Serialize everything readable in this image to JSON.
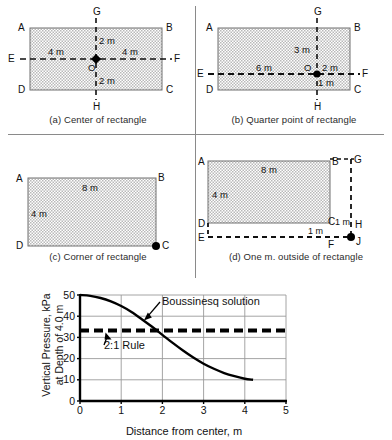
{
  "figure": {
    "panels": [
      {
        "id": "a",
        "caption": "(a) Center of rectangle",
        "corners": {
          "tl": "A",
          "tr": "B",
          "bl": "D",
          "br": "C"
        },
        "axis_points": {
          "top": "G",
          "bottom": "H",
          "left": "E",
          "right": "F"
        },
        "load_point": "O",
        "dims": {
          "up": "2 m",
          "down": "2 m",
          "left": "4 m",
          "right": "4 m"
        }
      },
      {
        "id": "b",
        "caption": "(b) Quarter point of rectangle",
        "corners": {
          "tl": "A",
          "tr": "B",
          "bl": "D",
          "br": "C"
        },
        "axis_points": {
          "top": "G",
          "bottom": "H",
          "left": "E",
          "right": "F"
        },
        "load_point": "O",
        "dims": {
          "up": "3 m",
          "down": "1 m",
          "left": "6 m",
          "right": "2 m"
        }
      },
      {
        "id": "c",
        "caption": "(c) Corner of rectangle",
        "corners": {
          "tl": "A",
          "tr": "B",
          "bl": "D",
          "br": "C"
        },
        "load_point": "C",
        "dims": {
          "width": "8 m",
          "height": "4 m"
        }
      },
      {
        "id": "d",
        "caption": "(d) One m. outside of rectangle",
        "corners": {
          "tl": "A",
          "tr": "B",
          "bl": "D",
          "br": "C"
        },
        "outer_points": {
          "tr": "G",
          "mr": "H",
          "bl": "E",
          "bm": "F",
          "br": "J"
        },
        "load_point": "J",
        "dims": {
          "width": "8 m",
          "height": "4 m",
          "offset_v": "1 m",
          "offset_h": "1 m"
        }
      }
    ]
  },
  "chart_data": {
    "type": "line",
    "title": "",
    "xlabel": "Distance from center, m",
    "ylabel": "Vertical Pressure, kPa at Depth of 4.0 m",
    "ylabel_line1": "Vertical Pressure, kPa",
    "ylabel_line2": "at Depth of 4.0 m",
    "xlim": [
      0,
      5
    ],
    "ylim": [
      0,
      50
    ],
    "xticks": [
      0,
      1,
      2,
      3,
      4,
      5
    ],
    "yticks": [
      0,
      10,
      20,
      30,
      40,
      50
    ],
    "grid": true,
    "series": [
      {
        "name": "Boussinesq solution",
        "style": "solid",
        "x": [
          0.0,
          0.25,
          0.5,
          0.75,
          1.0,
          1.25,
          1.5,
          1.75,
          2.0,
          2.25,
          2.5,
          2.75,
          3.0,
          3.25,
          3.5,
          3.75,
          4.0,
          4.2
        ],
        "y": [
          50.0,
          49.6,
          48.6,
          47.0,
          44.8,
          42.0,
          38.6,
          35.0,
          31.2,
          27.4,
          23.8,
          20.5,
          17.6,
          15.2,
          13.2,
          11.7,
          10.5,
          10.0
        ]
      },
      {
        "name": "2:1 Rule",
        "style": "dashed",
        "x": [
          0.0,
          5.0
        ],
        "y": [
          33.3,
          33.3
        ]
      }
    ],
    "annotations": [
      {
        "text": "Boussinesq solution",
        "points_to_x": 1.55,
        "points_to_y": 38.0
      },
      {
        "text": "2:1 Rule",
        "points_to_x": 0.62,
        "points_to_y": 33.3
      }
    ]
  }
}
